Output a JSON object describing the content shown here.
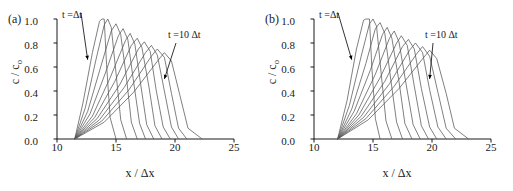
{
  "figure": {
    "width": 513,
    "height": 191,
    "background": "#ffffff",
    "line_color": "#555555",
    "axis_color": "#000000"
  },
  "panels": [
    {
      "tag": "(a)",
      "annotation_first": "t =Δt",
      "annotation_last": "t =10 Δt",
      "xlabel": "x / Δx",
      "ylabel_main": "c / c",
      "ylabel_sub": "o",
      "xticks": [
        "10",
        "15",
        "20",
        "25"
      ],
      "yticks": [
        "0.0",
        "0.2",
        "0.4",
        "0.6",
        "0.8",
        "1.0"
      ]
    },
    {
      "tag": "(b)",
      "annotation_first": "t =Δt",
      "annotation_last": "t =10 Δt",
      "xlabel": "x / Δx",
      "ylabel_main": "c / c",
      "ylabel_sub": "o",
      "xticks": [
        "10",
        "15",
        "20",
        "25"
      ],
      "yticks": [
        "0.0",
        "0.2",
        "0.4",
        "0.6",
        "0.8",
        "1.0"
      ]
    }
  ],
  "chart_data": [
    {
      "type": "line",
      "panel": "(a)",
      "title": "",
      "xlabel": "x / Δx",
      "ylabel": "c / c_o",
      "xlim": [
        10,
        25
      ],
      "ylim": [
        0.0,
        1.0
      ],
      "xticks": [
        10,
        15,
        20,
        25
      ],
      "yticks": [
        0.0,
        0.2,
        0.4,
        0.6,
        0.8,
        1.0
      ],
      "grid": false,
      "legend": "none",
      "annotations": [
        {
          "text": "t =Δt",
          "points_to_x": 12.6,
          "points_to_y": 0.66
        },
        {
          "text": "t =10 Δt",
          "points_to_x": 19.1,
          "points_to_y": 0.5
        }
      ],
      "series": [
        {
          "name": "t = 1 Δt",
          "peak_x": 13.8,
          "peak_y": 1.0,
          "x": [
            11.5,
            12.2,
            13.0,
            13.6,
            13.8,
            14.0,
            14.2,
            14.5,
            15.0
          ],
          "y": [
            0.0,
            0.3,
            0.72,
            0.98,
            1.0,
            1.0,
            0.62,
            0.18,
            0.0
          ]
        },
        {
          "name": "t = 2 Δt",
          "peak_x": 14.3,
          "peak_y": 1.0,
          "x": [
            11.5,
            12.4,
            13.3,
            14.0,
            14.3,
            14.6,
            15.0,
            15.4,
            15.9
          ],
          "y": [
            0.0,
            0.26,
            0.66,
            0.95,
            1.0,
            0.93,
            0.55,
            0.16,
            0.0
          ]
        },
        {
          "name": "t = 3 Δt",
          "peak_x": 15.0,
          "peak_y": 0.96,
          "x": [
            11.5,
            12.6,
            13.7,
            14.6,
            15.0,
            15.4,
            15.9,
            16.3,
            16.8
          ],
          "y": [
            0.0,
            0.23,
            0.6,
            0.9,
            0.96,
            0.87,
            0.5,
            0.14,
            0.0
          ]
        },
        {
          "name": "t = 4 Δt",
          "peak_x": 15.6,
          "peak_y": 0.92,
          "x": [
            11.5,
            12.8,
            14.1,
            15.2,
            15.6,
            16.0,
            16.5,
            17.0,
            17.5
          ],
          "y": [
            0.0,
            0.21,
            0.55,
            0.86,
            0.92,
            0.83,
            0.47,
            0.13,
            0.0
          ]
        },
        {
          "name": "t = 5 Δt",
          "peak_x": 16.2,
          "peak_y": 0.88,
          "x": [
            11.5,
            13.0,
            14.5,
            15.8,
            16.2,
            16.6,
            17.1,
            17.6,
            18.2
          ],
          "y": [
            0.0,
            0.19,
            0.51,
            0.82,
            0.88,
            0.79,
            0.45,
            0.12,
            0.0
          ]
        },
        {
          "name": "t = 6 Δt",
          "peak_x": 16.8,
          "peak_y": 0.84,
          "x": [
            11.5,
            13.2,
            14.9,
            16.3,
            16.8,
            17.2,
            17.8,
            18.3,
            18.9
          ],
          "y": [
            0.0,
            0.18,
            0.48,
            0.78,
            0.84,
            0.76,
            0.43,
            0.11,
            0.0
          ]
        },
        {
          "name": "t = 7 Δt",
          "peak_x": 17.4,
          "peak_y": 0.81,
          "x": [
            11.5,
            13.4,
            15.3,
            16.9,
            17.4,
            17.9,
            18.4,
            19.0,
            19.6
          ],
          "y": [
            0.0,
            0.17,
            0.45,
            0.75,
            0.81,
            0.73,
            0.41,
            0.1,
            0.0
          ]
        },
        {
          "name": "t = 8 Δt",
          "peak_x": 18.0,
          "peak_y": 0.78,
          "x": [
            11.5,
            13.6,
            15.7,
            17.5,
            18.0,
            18.5,
            19.1,
            19.7,
            20.3
          ],
          "y": [
            0.0,
            0.16,
            0.43,
            0.72,
            0.78,
            0.7,
            0.4,
            0.1,
            0.0
          ]
        },
        {
          "name": "t = 9 Δt",
          "peak_x": 18.5,
          "peak_y": 0.75,
          "x": [
            11.5,
            13.8,
            16.1,
            18.0,
            18.5,
            19.1,
            19.7,
            20.3,
            21.0
          ],
          "y": [
            0.0,
            0.15,
            0.41,
            0.69,
            0.75,
            0.68,
            0.38,
            0.09,
            0.0
          ]
        },
        {
          "name": "t = 10 Δt",
          "peak_x": 19.1,
          "peak_y": 0.72,
          "x": [
            11.5,
            14.0,
            16.5,
            18.6,
            19.1,
            19.7,
            20.4,
            21.1,
            22.3
          ],
          "y": [
            0.0,
            0.14,
            0.39,
            0.66,
            0.72,
            0.65,
            0.37,
            0.09,
            0.0
          ]
        }
      ]
    },
    {
      "type": "line",
      "panel": "(b)",
      "title": "",
      "xlabel": "x / Δx",
      "ylabel": "c / c_o",
      "xlim": [
        10,
        25
      ],
      "ylim": [
        0.0,
        1.0
      ],
      "xticks": [
        10,
        15,
        20,
        25
      ],
      "yticks": [
        0.0,
        0.2,
        0.4,
        0.6,
        0.8,
        1.0
      ],
      "grid": false,
      "legend": "none",
      "annotations": [
        {
          "text": "t =Δt",
          "points_to_x": 13.2,
          "points_to_y": 0.66
        },
        {
          "text": "t =10 Δt",
          "points_to_x": 19.8,
          "points_to_y": 0.5
        }
      ],
      "series": [
        {
          "name": "t = 1 Δt",
          "peak_x": 14.4,
          "peak_y": 1.0,
          "x": [
            12.0,
            12.8,
            13.6,
            14.2,
            14.4,
            14.7,
            14.9,
            15.2,
            15.6
          ],
          "y": [
            0.0,
            0.32,
            0.75,
            0.99,
            1.0,
            1.0,
            0.6,
            0.17,
            0.0
          ]
        },
        {
          "name": "t = 2 Δt",
          "peak_x": 15.0,
          "peak_y": 1.0,
          "x": [
            12.0,
            13.0,
            14.0,
            14.7,
            15.0,
            15.3,
            15.7,
            16.1,
            16.6
          ],
          "y": [
            0.0,
            0.28,
            0.69,
            0.96,
            1.0,
            0.94,
            0.54,
            0.15,
            0.0
          ]
        },
        {
          "name": "t = 3 Δt",
          "peak_x": 15.6,
          "peak_y": 0.97,
          "x": [
            12.0,
            13.2,
            14.4,
            15.2,
            15.6,
            16.0,
            16.5,
            17.0,
            17.5
          ],
          "y": [
            0.0,
            0.25,
            0.63,
            0.92,
            0.97,
            0.88,
            0.5,
            0.14,
            0.0
          ]
        },
        {
          "name": "t = 4 Δt",
          "peak_x": 16.2,
          "peak_y": 0.93,
          "x": [
            12.0,
            13.4,
            14.8,
            15.8,
            16.2,
            16.6,
            17.2,
            17.7,
            18.3
          ],
          "y": [
            0.0,
            0.23,
            0.58,
            0.87,
            0.93,
            0.84,
            0.48,
            0.13,
            0.0
          ]
        },
        {
          "name": "t = 5 Δt",
          "peak_x": 16.8,
          "peak_y": 0.9,
          "x": [
            12.0,
            13.6,
            15.2,
            16.4,
            16.8,
            17.2,
            17.8,
            18.4,
            19.0
          ],
          "y": [
            0.0,
            0.21,
            0.54,
            0.84,
            0.9,
            0.81,
            0.46,
            0.12,
            0.0
          ]
        },
        {
          "name": "t = 6 Δt",
          "peak_x": 17.4,
          "peak_y": 0.86,
          "x": [
            12.0,
            13.8,
            15.6,
            17.0,
            17.4,
            17.9,
            18.5,
            19.1,
            19.7
          ],
          "y": [
            0.0,
            0.2,
            0.51,
            0.8,
            0.86,
            0.78,
            0.44,
            0.11,
            0.0
          ]
        },
        {
          "name": "t = 7 Δt",
          "peak_x": 18.0,
          "peak_y": 0.83,
          "x": [
            12.0,
            14.0,
            16.0,
            17.5,
            18.0,
            18.5,
            19.1,
            19.8,
            20.4
          ],
          "y": [
            0.0,
            0.19,
            0.48,
            0.77,
            0.83,
            0.75,
            0.42,
            0.1,
            0.0
          ]
        },
        {
          "name": "t = 8 Δt",
          "peak_x": 18.6,
          "peak_y": 0.8,
          "x": [
            12.0,
            14.2,
            16.4,
            18.1,
            18.6,
            19.2,
            19.8,
            20.5,
            21.2
          ],
          "y": [
            0.0,
            0.18,
            0.46,
            0.74,
            0.8,
            0.72,
            0.41,
            0.1,
            0.0
          ]
        },
        {
          "name": "t = 9 Δt",
          "peak_x": 19.2,
          "peak_y": 0.77,
          "x": [
            12.0,
            14.4,
            16.8,
            18.7,
            19.2,
            19.8,
            20.5,
            21.2,
            22.0
          ],
          "y": [
            0.0,
            0.17,
            0.44,
            0.71,
            0.77,
            0.69,
            0.39,
            0.09,
            0.0
          ]
        },
        {
          "name": "t = 10 Δt",
          "peak_x": 19.8,
          "peak_y": 0.74,
          "x": [
            12.0,
            14.6,
            17.2,
            19.3,
            19.8,
            20.4,
            21.2,
            21.9,
            23.1
          ],
          "y": [
            0.0,
            0.16,
            0.42,
            0.68,
            0.74,
            0.67,
            0.38,
            0.09,
            0.0
          ]
        }
      ]
    }
  ]
}
